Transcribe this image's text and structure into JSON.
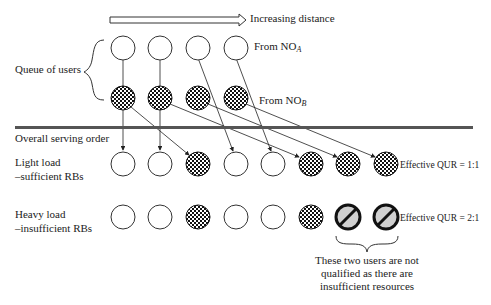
{
  "diagram": {
    "arrow_label": "Increasing distance",
    "queue_label": "Queue of users",
    "from_a": {
      "prefix": "From NO",
      "sub": "A"
    },
    "from_b": {
      "prefix": "From NO",
      "sub": "B"
    },
    "divider_label": "Overall serving order",
    "light_load": {
      "line1": "Light load",
      "line2": "–sufficient RBs",
      "qur": "Effective QUR = 1:1"
    },
    "heavy_load": {
      "line1": "Heavy load",
      "line2": "–insufficient RBs",
      "qur": "Effective QUR = 2:1"
    },
    "note": [
      "These two users are not",
      "qualified as there are",
      "insufficient resources"
    ],
    "rows": {
      "from_a": [
        "open",
        "open",
        "open",
        "open"
      ],
      "from_b": [
        "checkered",
        "checkered",
        "checkered",
        "checkered"
      ],
      "light": [
        "open",
        "open",
        "checkered",
        "open",
        "open",
        "checkered",
        "checkered",
        "checkered"
      ],
      "heavy": [
        "open",
        "open",
        "checkered",
        "open",
        "open",
        "checkered",
        "blocked",
        "blocked"
      ]
    },
    "colors": {
      "line": "#222222",
      "divider": "#555555",
      "blocked_fill": "#d0d0d0"
    }
  }
}
